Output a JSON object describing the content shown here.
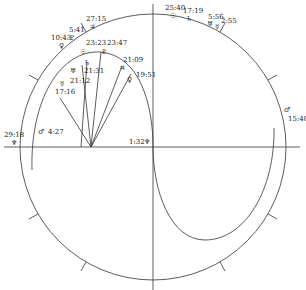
{
  "chart": {
    "type": "astrological-horoscope-diagram",
    "colors": {
      "line": "#333333",
      "text": "#222222",
      "background": "#ffffff"
    },
    "outer_planets": [
      {
        "symbol": "♀",
        "name": "venus",
        "position": "10:43"
      },
      {
        "symbol": "♇",
        "name": "pluto",
        "position": "5:41"
      },
      {
        "symbol": "♃",
        "name": "jupiter",
        "position": "27:15"
      },
      {
        "symbol": "☉",
        "name": "sun",
        "position": "25:40"
      },
      {
        "symbol": "♄",
        "name": "saturn",
        "position": "17:19"
      },
      {
        "symbol": "♅",
        "name": "uranus",
        "position": "5:56"
      },
      {
        "symbol": "☿",
        "name": "mercury",
        "position": "2:55"
      },
      {
        "symbol": "♂",
        "name": "mars",
        "position": "15:40"
      },
      {
        "symbol": "♆",
        "name": "neptune",
        "position": "29:18"
      }
    ],
    "inner_planets": [
      {
        "symbol": "☉",
        "name": "sun",
        "position": "23:23"
      },
      {
        "symbol": "♇",
        "name": "pluto",
        "position": "23:47"
      },
      {
        "symbol": "♄",
        "name": "saturn",
        "position": "21:31"
      },
      {
        "symbol": "♅",
        "name": "uranus",
        "position": "21:12"
      },
      {
        "symbol": "☿",
        "name": "mercury",
        "position": "17:16"
      },
      {
        "symbol": "♃",
        "name": "jupiter",
        "position": "21:09"
      },
      {
        "symbol": "♀",
        "name": "venus",
        "position": "19:51"
      },
      {
        "symbol": "♂",
        "name": "mars",
        "position": "4:27"
      },
      {
        "symbol": "♆",
        "name": "neptune",
        "position": "1:32"
      }
    ]
  }
}
